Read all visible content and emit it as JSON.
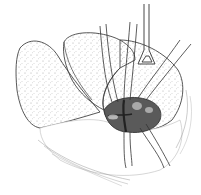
{
  "figure": {
    "type": "surgical-line-illustration",
    "colors": {
      "background": "#ffffff",
      "line": "#333333",
      "stipple": "#888888",
      "dark_field": "#555555"
    }
  }
}
